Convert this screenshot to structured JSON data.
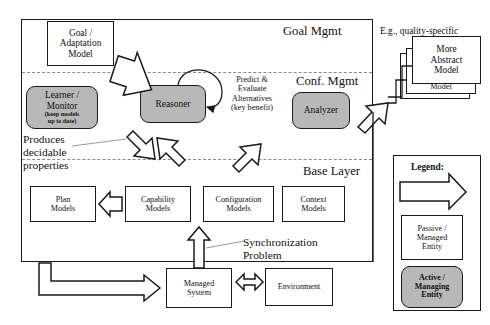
{
  "diagram": {
    "layers": {
      "goal_mgmt_label": "Goal Mgmt",
      "conf_mgmt_label": "Conf. Mgmt",
      "base_layer_label": "Base Layer"
    },
    "boxes": {
      "goal_adaptation_model": "Goal /\nAdaptation\nModel",
      "learner_monitor_title": "Learner /\nMonitor",
      "learner_monitor_sub": "(keep models\nup to date)",
      "reasoner": "Reasoner",
      "analyzer": "Analyzer",
      "plan_models": "Plan\nModels",
      "capability_models": "Capability\nModels",
      "configuration_models": "Configuration\nModels",
      "context_models": "Context\nModels",
      "managed_system": "Managed\nSystem",
      "environment": "Environment",
      "more_abstract_model": "More\nAbstract\nModel",
      "stacked_model_1": "Model",
      "stacked_model_2": "Model"
    },
    "annotations": {
      "predict_evaluate": "Predict &\nEvaluate\nAlternatives\n(key benefit)",
      "produces_decidable": "Produces\ndecidable\nproperties",
      "synchronization_problem": "Synchronization\nProblem",
      "quality_specific": "E.g., quality-specific"
    },
    "legend": {
      "title": "Legend:",
      "data_flow": "Data flow",
      "passive_entity": "Passive /\nManaged\nEntity",
      "active_entity": "Active /\nManaging\nEntity"
    },
    "colors": {
      "active_fill": "#b8b8b8",
      "passive_fill": "#ffffff",
      "stroke": "#1a1a1a",
      "dashed_stroke": "#8a8a8a",
      "background": "#ffffff"
    }
  }
}
